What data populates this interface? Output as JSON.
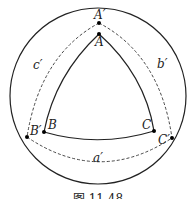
{
  "figure": {
    "caption": "图 11.48",
    "outer_circle": {
      "cx": 98,
      "cy": 96,
      "r": 88
    },
    "triangle": {
      "vertices": {
        "A": {
          "label": "A",
          "x": 99,
          "y": 34
        },
        "B": {
          "label": "B",
          "x": 44,
          "y": 132
        },
        "C": {
          "label": "C",
          "x": 154,
          "y": 131
        }
      },
      "style": "solid"
    },
    "polar_triangle": {
      "vertices": {
        "A_prime": {
          "label": "A′",
          "x": 99,
          "y": 23
        },
        "B_prime": {
          "label": "B′",
          "x": 27,
          "y": 137
        },
        "C_prime": {
          "label": "C′",
          "x": 172,
          "y": 138
        }
      },
      "style": "dashed"
    },
    "side_labels": {
      "a_prime": {
        "label": "a′",
        "x": 95,
        "y": 161
      },
      "b_prime": {
        "label": "b′",
        "x": 160,
        "y": 66
      },
      "c_prime": {
        "label": "c′",
        "x": 33,
        "y": 68
      }
    },
    "colors": {
      "stroke": "#222222",
      "background": "#ffffff"
    }
  }
}
